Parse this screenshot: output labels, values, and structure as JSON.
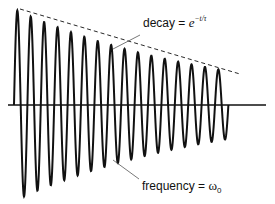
{
  "chart_data": {
    "type": "line",
    "title": "",
    "xlabel": "",
    "ylabel": "",
    "grid": false,
    "axis": {
      "baseline_y_px": 105,
      "x_start_px": 8,
      "x_end_px": 266
    },
    "signal": {
      "cycles": 16,
      "start_x_px": 14,
      "period_px": 13.4,
      "initial_amplitude_px": 96,
      "final_amplitude_px": 34,
      "color": "#111111"
    },
    "envelope": {
      "style": "dashed",
      "from": [
        20,
        9
      ],
      "to": [
        240,
        74
      ],
      "color": "#111111"
    },
    "annotations": [
      {
        "id": "decay",
        "text_prefix": "decay = ",
        "base": "e",
        "exponent": "−t/τ",
        "leader_from": [
          113,
          49
        ],
        "leader_to": [
          140,
          35
        ]
      },
      {
        "id": "frequency",
        "text_prefix": "frequency = ",
        "symbol": "ω",
        "subscript": "0",
        "leader_from": [
          113,
          160
        ],
        "leader_to": [
          139,
          179
        ]
      }
    ]
  }
}
